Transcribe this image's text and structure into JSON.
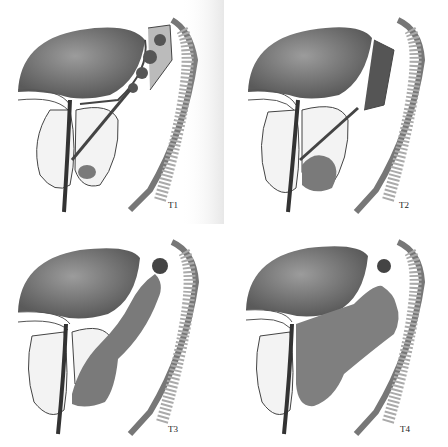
{
  "figure": {
    "type": "medical-illustration",
    "panels": [
      {
        "label": "T1",
        "position": "top-left",
        "tumor_extent": "small"
      },
      {
        "label": "T2",
        "position": "top-right",
        "tumor_extent": "medium"
      },
      {
        "label": "T3",
        "position": "bottom-left",
        "tumor_extent": "large, extending upward"
      },
      {
        "label": "T4",
        "position": "bottom-right",
        "tumor_extent": "extensive, invading adjacent structures"
      }
    ]
  },
  "colors": {
    "background": "#ffffff",
    "organ_dark": "#6b6b6b",
    "organ_mid": "#9a9a9a",
    "tumor": "#8a8a8a",
    "gland_fill": "#efefef",
    "line": "#3a3a3a"
  }
}
